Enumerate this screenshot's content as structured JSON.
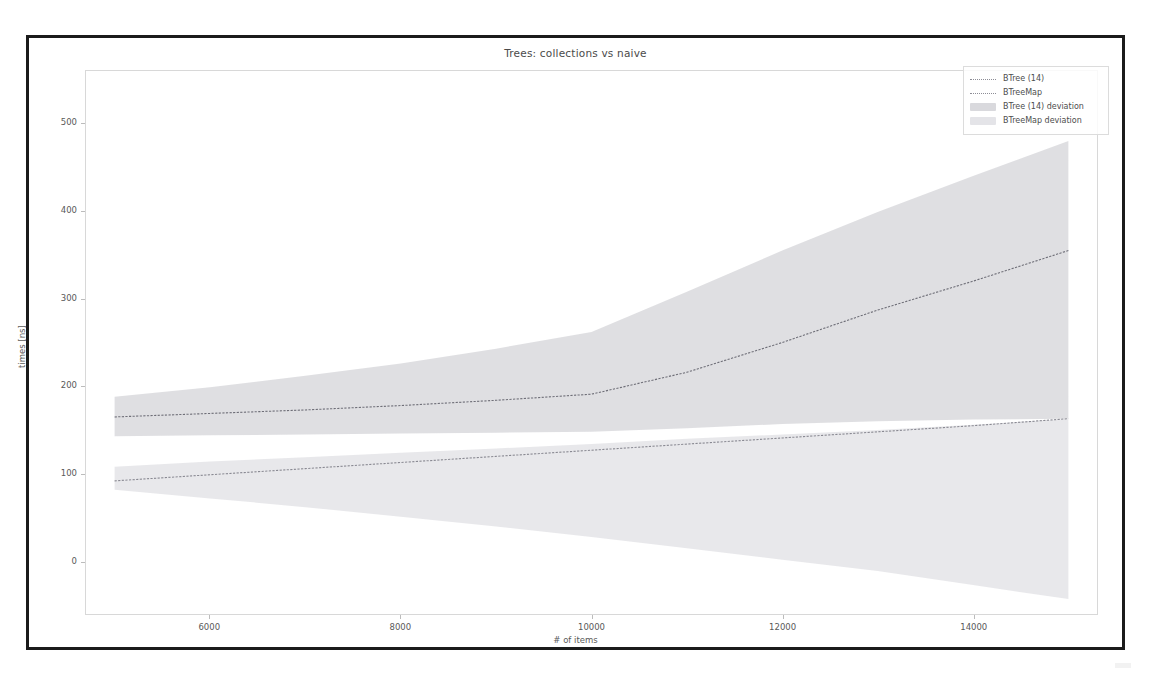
{
  "figure": {
    "title": "Trees: collections vs naive",
    "background_color": "#ffffff",
    "frame_color": "#1b1b1b"
  },
  "legend": {
    "position": "upper right",
    "entries": [
      {
        "label": "BTree (14)",
        "type": "line",
        "color": "#6f6f78"
      },
      {
        "label": "BTreeMap",
        "type": "line",
        "color": "#8a8a93"
      },
      {
        "label": "BTree (14) deviation",
        "type": "patch",
        "color": "#d9d9dd"
      },
      {
        "label": "BTreeMap deviation",
        "type": "patch",
        "color": "#e4e4e8"
      }
    ]
  },
  "chart_data": {
    "type": "line",
    "title": "Trees: collections vs naive",
    "xlabel": "# of items",
    "ylabel": "times [ns]",
    "xlim": [
      4700,
      15300
    ],
    "ylim": [
      -60,
      560
    ],
    "xticks": [
      6000,
      8000,
      10000,
      12000,
      14000
    ],
    "yticks": [
      0,
      100,
      200,
      300,
      400,
      500
    ],
    "xtick_labels": [
      "6000",
      "8000",
      "10000",
      "12000",
      "14000"
    ],
    "ytick_labels": [
      "0",
      "100",
      "200",
      "300",
      "400",
      "500"
    ],
    "grid": false,
    "x": [
      5000,
      6000,
      7000,
      8000,
      9000,
      10000,
      11000,
      12000,
      13000,
      14000,
      15000
    ],
    "series": [
      {
        "name": "BTree (14)",
        "kind": "line",
        "color": "#6f6f78",
        "values": [
          165,
          169,
          173,
          178,
          184,
          191,
          216,
          250,
          287,
          320,
          355
        ],
        "deviation_band": {
          "name": "BTree (14) deviation",
          "color": "#d9d9dd",
          "lower": [
            143,
            144,
            145,
            146,
            147,
            148,
            152,
            157,
            160,
            162,
            163
          ],
          "upper": [
            188,
            199,
            212,
            226,
            243,
            262,
            308,
            355,
            399,
            440,
            480
          ]
        }
      },
      {
        "name": "BTreeMap",
        "kind": "line",
        "color": "#8a8a93",
        "values": [
          92,
          99,
          106,
          113,
          120,
          127,
          134,
          141,
          148,
          155,
          163
        ],
        "deviation_band": {
          "name": "BTreeMap deviation",
          "color": "#e4e4e8",
          "lower": [
            82,
            72,
            62,
            51,
            40,
            28,
            15,
            2,
            -11,
            -27,
            -43
          ],
          "upper": [
            108,
            114,
            119,
            124,
            129,
            134,
            140,
            145,
            150,
            156,
            163
          ]
        }
      }
    ]
  }
}
